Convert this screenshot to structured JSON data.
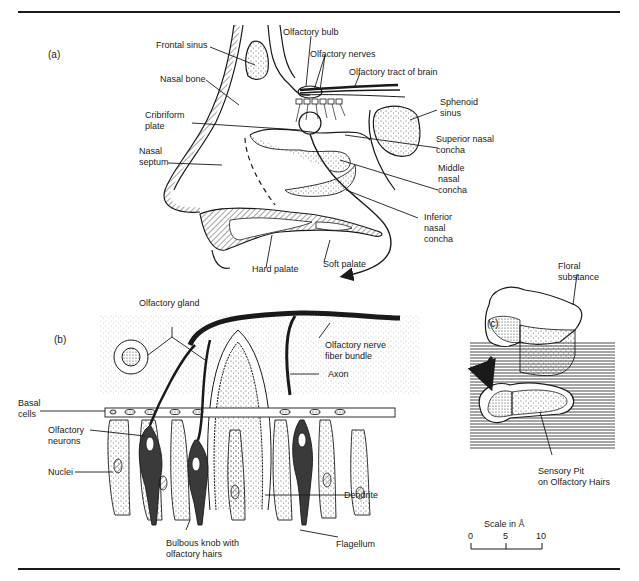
{
  "figure": {
    "panels": [
      "(a)",
      "(b)",
      "(c)"
    ]
  },
  "panel_a": {
    "label": "(a)",
    "labels": {
      "frontal_sinus": "Frontal sinus",
      "nasal_bone": "Nasal bone",
      "cribriform_plate": "Cribriform\nplate",
      "nasal_septum": "Nasal\nseptum",
      "olfactory_bulb": "Olfactory bulb",
      "olfactory_nerves": "Olfactory nerves",
      "olfactory_tract": "Olfactory tract of brain",
      "sphenoid_sinus": "Sphenoid\nsinus",
      "superior_nasal_concha": "Superior nasal\nconcha",
      "middle_nasal_concha": "Middle\nnasal\nconcha",
      "inferior_nasal_concha": "Inferior\nnasal\nconcha",
      "hard_palate": "Hard palate",
      "soft_palate": "Soft palate"
    }
  },
  "panel_b": {
    "label": "(b)",
    "labels": {
      "olfactory_gland": "Olfactory gland",
      "olfactory_nerve_fiber_bundle": "Olfactory nerve\nfiber bundle",
      "axon": "Axon",
      "basal_cells": "Basal\ncells",
      "olfactory_neurons": "Olfactory\nneurons",
      "nuclei": "Nuclei",
      "dendrite": "Dendrite",
      "bulbous_knob": "Bulbous knob with\nolfactory hairs",
      "flagellum": "Flagellum"
    }
  },
  "panel_c": {
    "label": "(c)",
    "labels": {
      "floral_substance": "Floral\nsubstance",
      "sensory_pit": "Sensory Pit\non Olfactory Hairs"
    },
    "scale": {
      "title": "Scale in Å",
      "ticks": [
        "0",
        "5",
        "10"
      ]
    }
  },
  "colors": {
    "ink": "#1a1a1a",
    "background": "#ffffff",
    "stipple": "#555555"
  }
}
